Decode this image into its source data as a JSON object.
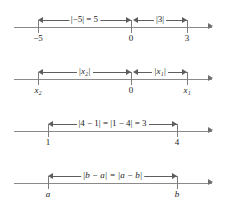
{
  "figure": {
    "background_color": "#ffffff",
    "axis_color": "#8a8a8a",
    "text_color": "#1a1a1a"
  },
  "lines": [
    {
      "name": "line-1",
      "ticks": [
        {
          "label": "−5",
          "italic": false
        },
        {
          "label": "0",
          "italic": false
        },
        {
          "label": "3",
          "italic": false
        }
      ],
      "spans": [
        {
          "label": "|−5| = 5"
        },
        {
          "label": "|3|"
        }
      ]
    },
    {
      "name": "line-2",
      "ticks": [
        {
          "label": "x₂",
          "italic": true
        },
        {
          "label": "0",
          "italic": false
        },
        {
          "label": "x₁",
          "italic": true
        }
      ],
      "spans": [
        {
          "label": "|x₂|"
        },
        {
          "label": "|x₁|"
        }
      ]
    },
    {
      "name": "line-3",
      "ticks": [
        {
          "label": "1",
          "italic": false
        },
        {
          "label": "4",
          "italic": false
        }
      ],
      "spans": [
        {
          "label": "|4 − 1| = |1 − 4| = 3"
        }
      ]
    },
    {
      "name": "line-4",
      "ticks": [
        {
          "label": "a",
          "italic": true
        },
        {
          "label": "b",
          "italic": true
        }
      ],
      "spans": [
        {
          "label": "|b − a| = |a − b|"
        }
      ]
    }
  ]
}
